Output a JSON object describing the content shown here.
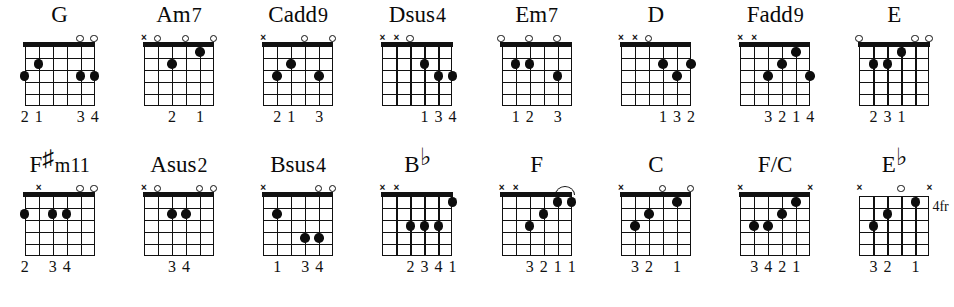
{
  "sheet": {
    "title": "Guitar Chord Chart",
    "string_count": 6,
    "fret_count": 5,
    "rows": [
      {
        "name": "top-row",
        "chords": [
          {
            "name": "G",
            "root": "G",
            "accidental": "",
            "suffix": "",
            "position_label": "",
            "open_nut": true,
            "markers": [
              "",
              "",
              "",
              "",
              "o",
              "o"
            ],
            "dots": [
              {
                "string": 6,
                "fret": 3
              },
              {
                "string": 5,
                "fret": 2
              },
              {
                "string": 2,
                "fret": 3
              },
              {
                "string": 1,
                "fret": 3
              }
            ],
            "barres": [],
            "fingers": [
              {
                "string": 6,
                "num": "2"
              },
              {
                "string": 5,
                "num": "1"
              },
              {
                "string": 2,
                "num": "3"
              },
              {
                "string": 1,
                "num": "4"
              }
            ]
          },
          {
            "name": "Am7",
            "root": "Am",
            "accidental": "",
            "suffix": "7",
            "position_label": "",
            "open_nut": true,
            "markers": [
              "x",
              "o",
              "",
              "o",
              "",
              "o"
            ],
            "dots": [
              {
                "string": 4,
                "fret": 2
              },
              {
                "string": 2,
                "fret": 1
              }
            ],
            "barres": [],
            "fingers": [
              {
                "string": 4,
                "num": "2"
              },
              {
                "string": 2,
                "num": "1"
              }
            ]
          },
          {
            "name": "Cadd9",
            "root": "Cadd",
            "accidental": "",
            "suffix": "9",
            "position_label": "",
            "open_nut": true,
            "markers": [
              "x",
              "",
              "",
              "o",
              "",
              "o"
            ],
            "dots": [
              {
                "string": 5,
                "fret": 3
              },
              {
                "string": 4,
                "fret": 2
              },
              {
                "string": 2,
                "fret": 3
              }
            ],
            "barres": [],
            "fingers": [
              {
                "string": 5,
                "num": "2"
              },
              {
                "string": 4,
                "num": "1"
              },
              {
                "string": 2,
                "num": "3"
              }
            ]
          },
          {
            "name": "Dsus4",
            "root": "Dsus",
            "accidental": "",
            "suffix": "4",
            "position_label": "",
            "open_nut": true,
            "markers": [
              "x",
              "x",
              "o",
              "",
              "",
              ""
            ],
            "dots": [
              {
                "string": 3,
                "fret": 2
              },
              {
                "string": 2,
                "fret": 3
              },
              {
                "string": 1,
                "fret": 3
              }
            ],
            "barres": [],
            "fingers": [
              {
                "string": 3,
                "num": "1"
              },
              {
                "string": 2,
                "num": "3"
              },
              {
                "string": 1,
                "num": "4"
              }
            ]
          },
          {
            "name": "Em7",
            "root": "Em",
            "accidental": "",
            "suffix": "7",
            "position_label": "",
            "open_nut": true,
            "markers": [
              "o",
              "",
              "o",
              "",
              "o",
              ""
            ],
            "dots": [
              {
                "string": 5,
                "fret": 2
              },
              {
                "string": 4,
                "fret": 2
              },
              {
                "string": 2,
                "fret": 3
              }
            ],
            "barres": [],
            "fingers": [
              {
                "string": 5,
                "num": "1"
              },
              {
                "string": 4,
                "num": "2"
              },
              {
                "string": 2,
                "num": "3"
              }
            ]
          },
          {
            "name": "D",
            "root": "D",
            "accidental": "",
            "suffix": "",
            "position_label": "",
            "open_nut": true,
            "markers": [
              "x",
              "x",
              "o",
              "",
              "",
              ""
            ],
            "dots": [
              {
                "string": 3,
                "fret": 2
              },
              {
                "string": 2,
                "fret": 3
              },
              {
                "string": 1,
                "fret": 2
              }
            ],
            "barres": [],
            "fingers": [
              {
                "string": 3,
                "num": "1"
              },
              {
                "string": 2,
                "num": "3"
              },
              {
                "string": 1,
                "num": "2"
              }
            ]
          },
          {
            "name": "Fadd9",
            "root": "Fadd",
            "accidental": "",
            "suffix": "9",
            "position_label": "",
            "open_nut": true,
            "markers": [
              "x",
              "x",
              "",
              "",
              "",
              ""
            ],
            "dots": [
              {
                "string": 4,
                "fret": 3
              },
              {
                "string": 3,
                "fret": 2
              },
              {
                "string": 2,
                "fret": 1
              },
              {
                "string": 1,
                "fret": 3
              }
            ],
            "barres": [],
            "fingers": [
              {
                "string": 4,
                "num": "3"
              },
              {
                "string": 3,
                "num": "2"
              },
              {
                "string": 2,
                "num": "1"
              },
              {
                "string": 1,
                "num": "4"
              }
            ]
          },
          {
            "name": "E",
            "root": "E",
            "accidental": "",
            "suffix": "",
            "position_label": "",
            "open_nut": true,
            "markers": [
              "o",
              "",
              "",
              "",
              "o",
              "o"
            ],
            "dots": [
              {
                "string": 5,
                "fret": 2
              },
              {
                "string": 4,
                "fret": 2
              },
              {
                "string": 3,
                "fret": 1
              }
            ],
            "barres": [],
            "fingers": [
              {
                "string": 5,
                "num": "2"
              },
              {
                "string": 4,
                "num": "3"
              },
              {
                "string": 3,
                "num": "1"
              }
            ]
          }
        ]
      },
      {
        "name": "bottom-row",
        "chords": [
          {
            "name": "F#m11",
            "root": "F",
            "accidental": "#",
            "suffix": "m11",
            "position_label": "",
            "open_nut": true,
            "markers": [
              "",
              "x",
              "",
              "",
              "o",
              "o"
            ],
            "dots": [
              {
                "string": 6,
                "fret": 2
              },
              {
                "string": 4,
                "fret": 2
              },
              {
                "string": 3,
                "fret": 2
              }
            ],
            "barres": [],
            "fingers": [
              {
                "string": 6,
                "num": "2"
              },
              {
                "string": 4,
                "num": "3"
              },
              {
                "string": 3,
                "num": "4"
              }
            ]
          },
          {
            "name": "Asus2",
            "root": "Asus",
            "accidental": "",
            "suffix": "2",
            "position_label": "",
            "open_nut": true,
            "markers": [
              "x",
              "o",
              "",
              "",
              "o",
              "o"
            ],
            "dots": [
              {
                "string": 4,
                "fret": 2
              },
              {
                "string": 3,
                "fret": 2
              }
            ],
            "barres": [],
            "fingers": [
              {
                "string": 4,
                "num": "3"
              },
              {
                "string": 3,
                "num": "4"
              }
            ]
          },
          {
            "name": "Bsus4",
            "root": "Bsus",
            "accidental": "",
            "suffix": "4",
            "position_label": "",
            "open_nut": true,
            "markers": [
              "x",
              "",
              "",
              "",
              "o",
              "o"
            ],
            "dots": [
              {
                "string": 5,
                "fret": 2
              },
              {
                "string": 3,
                "fret": 4
              },
              {
                "string": 2,
                "fret": 4
              }
            ],
            "barres": [],
            "fingers": [
              {
                "string": 5,
                "num": "1"
              },
              {
                "string": 3,
                "num": "3"
              },
              {
                "string": 2,
                "num": "4"
              }
            ]
          },
          {
            "name": "Bb",
            "root": "B",
            "accidental": "b",
            "suffix": "",
            "position_label": "",
            "open_nut": true,
            "markers": [
              "x",
              "x",
              "",
              "",
              "",
              ""
            ],
            "dots": [
              {
                "string": 4,
                "fret": 3
              },
              {
                "string": 3,
                "fret": 3
              },
              {
                "string": 2,
                "fret": 3
              },
              {
                "string": 1,
                "fret": 1
              }
            ],
            "barres": [],
            "fingers": [
              {
                "string": 4,
                "num": "2"
              },
              {
                "string": 3,
                "num": "3"
              },
              {
                "string": 2,
                "num": "4"
              },
              {
                "string": 1,
                "num": "1"
              }
            ]
          },
          {
            "name": "F",
            "root": "F",
            "accidental": "",
            "suffix": "",
            "position_label": "",
            "open_nut": true,
            "markers": [
              "x",
              "x",
              "",
              "",
              "",
              ""
            ],
            "dots": [
              {
                "string": 4,
                "fret": 3
              },
              {
                "string": 3,
                "fret": 2
              },
              {
                "string": 2,
                "fret": 1
              },
              {
                "string": 1,
                "fret": 1
              }
            ],
            "barres": [
              {
                "from_string": 2,
                "to_string": 1,
                "fret": 1
              }
            ],
            "fingers": [
              {
                "string": 4,
                "num": "3"
              },
              {
                "string": 3,
                "num": "2"
              },
              {
                "string": 2,
                "num": "1"
              },
              {
                "string": 1,
                "num": "1"
              }
            ]
          },
          {
            "name": "C",
            "root": "C",
            "accidental": "",
            "suffix": "",
            "position_label": "",
            "open_nut": true,
            "markers": [
              "x",
              "",
              "",
              "o",
              "",
              "o"
            ],
            "dots": [
              {
                "string": 5,
                "fret": 3
              },
              {
                "string": 4,
                "fret": 2
              },
              {
                "string": 2,
                "fret": 1
              }
            ],
            "barres": [],
            "fingers": [
              {
                "string": 5,
                "num": "3"
              },
              {
                "string": 4,
                "num": "2"
              },
              {
                "string": 2,
                "num": "1"
              }
            ]
          },
          {
            "name": "F/C",
            "root": "F/C",
            "accidental": "",
            "suffix": "",
            "position_label": "",
            "open_nut": true,
            "markers": [
              "x",
              "",
              "",
              "",
              "",
              "x"
            ],
            "dots": [
              {
                "string": 5,
                "fret": 3
              },
              {
                "string": 4,
                "fret": 3
              },
              {
                "string": 3,
                "fret": 2
              },
              {
                "string": 2,
                "fret": 1
              }
            ],
            "barres": [],
            "fingers": [
              {
                "string": 5,
                "num": "3"
              },
              {
                "string": 4,
                "num": "4"
              },
              {
                "string": 3,
                "num": "2"
              },
              {
                "string": 2,
                "num": "1"
              }
            ]
          },
          {
            "name": "Eb",
            "root": "E",
            "accidental": "b",
            "suffix": "",
            "position_label": "4fr",
            "open_nut": false,
            "markers": [
              "x",
              "",
              "",
              "o",
              "",
              "x"
            ],
            "dots": [
              {
                "string": 5,
                "fret": 3
              },
              {
                "string": 4,
                "fret": 2
              },
              {
                "string": 2,
                "fret": 1
              }
            ],
            "barres": [],
            "fingers": [
              {
                "string": 5,
                "num": "3"
              },
              {
                "string": 4,
                "num": "2"
              },
              {
                "string": 2,
                "num": "1"
              }
            ]
          }
        ]
      }
    ]
  }
}
